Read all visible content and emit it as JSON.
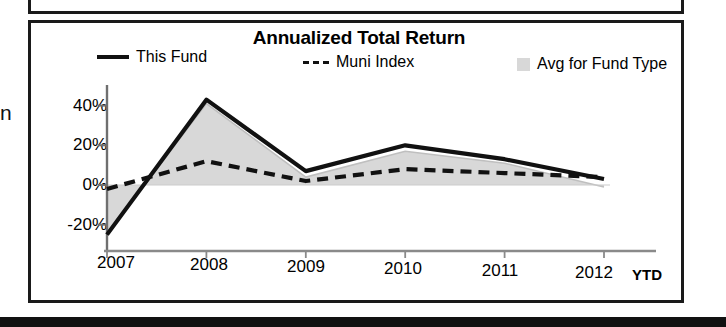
{
  "page": {
    "left_margin_clipped_text": "n"
  },
  "chart_card": {
    "title": "Annualized Total Return"
  },
  "legend": {
    "items": [
      {
        "label": "This Fund",
        "marker": "solid-line-swatch"
      },
      {
        "label": "Muni Index",
        "marker": "dashed-line-swatch"
      },
      {
        "label": "Avg for Fund Type",
        "marker": "gray-area-swatch"
      }
    ]
  },
  "axis": {
    "y_ticks": [
      "40%",
      "20%",
      "0%",
      "-20%"
    ],
    "x_ticks": [
      "2007",
      "2008",
      "2009",
      "2010",
      "2011",
      "2012"
    ],
    "x_suffix": "YTD"
  },
  "chart_data": {
    "type": "line",
    "title": "Annualized Total Return",
    "xlabel": "",
    "ylabel": "",
    "x": [
      "2007",
      "2008",
      "2009",
      "2010",
      "2011",
      "2012 YTD"
    ],
    "categories": [
      "2007",
      "2008",
      "2009",
      "2010",
      "2011",
      "2012 YTD"
    ],
    "ylim": [
      -33,
      48
    ],
    "ytick_values": [
      40,
      20,
      0,
      -20
    ],
    "ytick_labels": [
      "40%",
      "20%",
      "0%",
      "-20%"
    ],
    "grid": false,
    "legend_position": "top",
    "units": "percent",
    "series": [
      {
        "name": "This Fund",
        "style": "solid",
        "color": "#111111",
        "values": [
          -25,
          43,
          7,
          20,
          13,
          3
        ]
      },
      {
        "name": "Muni Index",
        "style": "dashed",
        "color": "#111111",
        "values": [
          -2,
          12,
          2,
          8,
          6,
          4
        ]
      },
      {
        "name": "Avg for Fund Type",
        "style": "filled-area",
        "color": "#d8d8d8",
        "values": [
          -25,
          41,
          4,
          17,
          11,
          -1
        ]
      }
    ]
  }
}
